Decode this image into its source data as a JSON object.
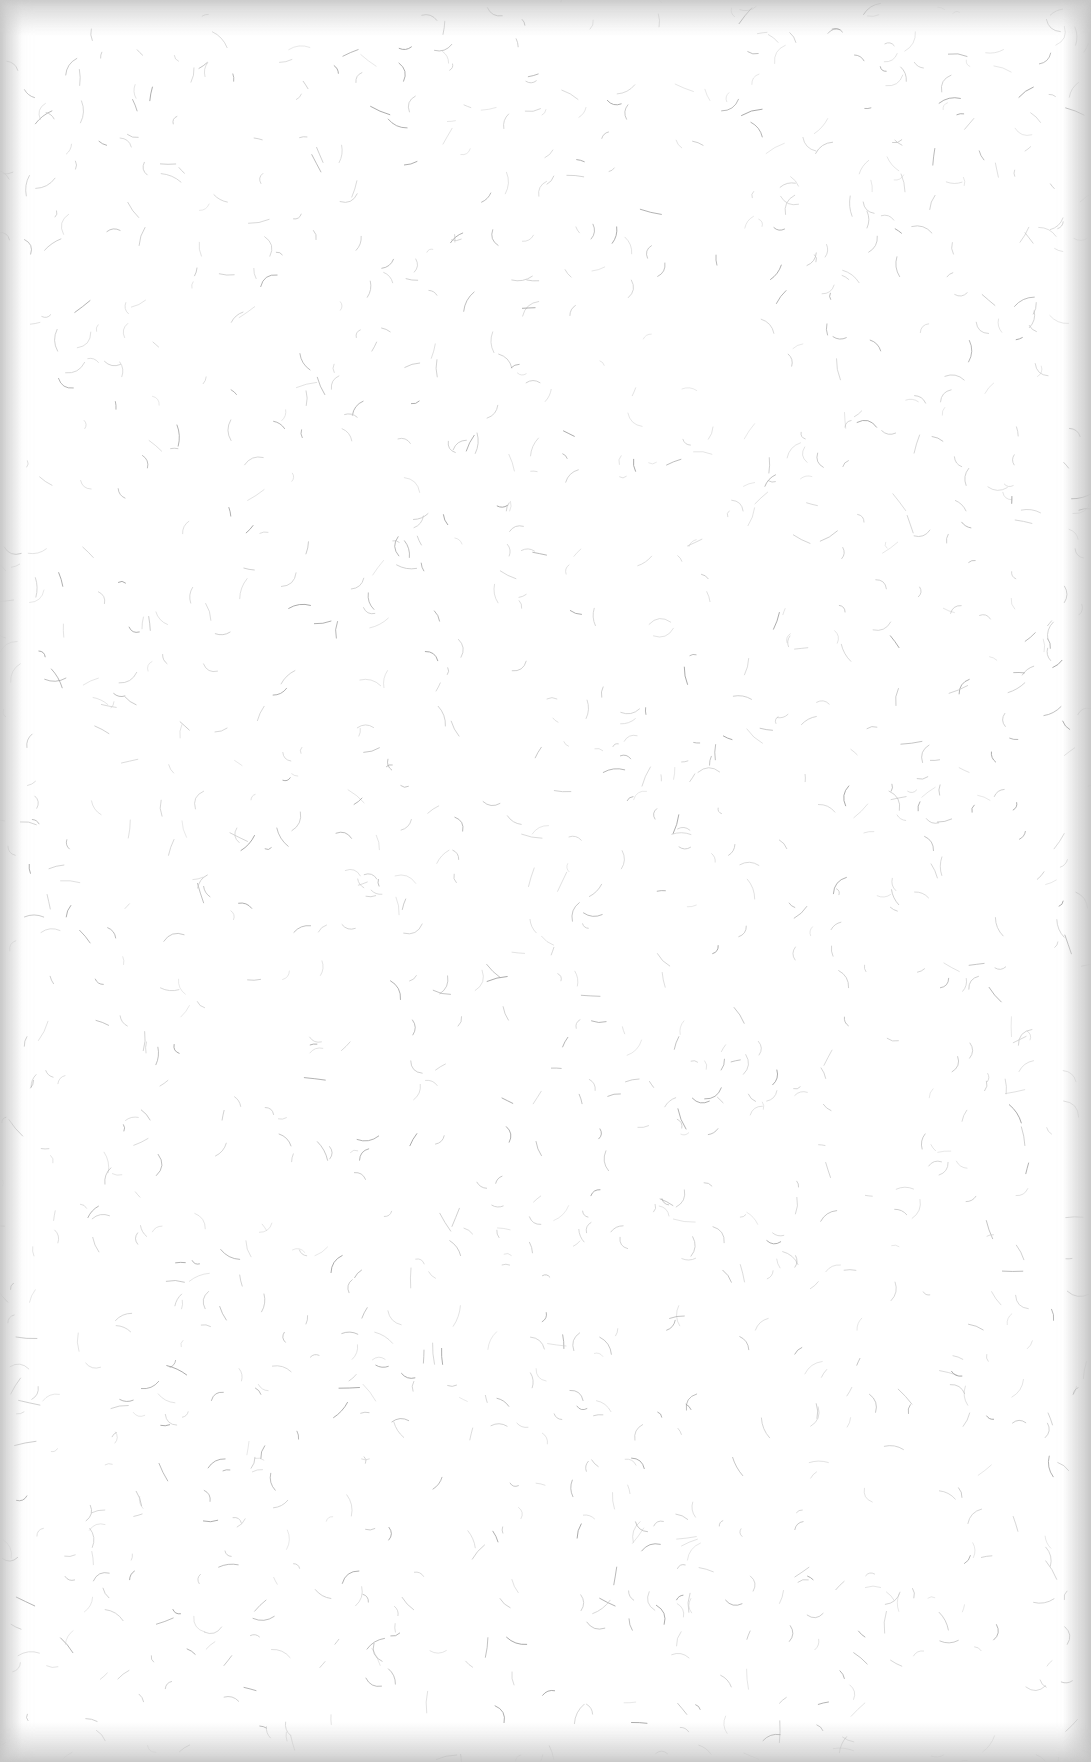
{
  "page": {
    "width": 1091,
    "height": 1762
  },
  "colors": {
    "paper": "#ffffff",
    "edge_shadow": "#d4d4d4",
    "fiber_dark": "#9a9a9a",
    "fiber_light": "#c8c8c8"
  },
  "texture": {
    "fiber_count": 1400,
    "seed": 17,
    "fiber_min_len": 6,
    "fiber_max_len": 22,
    "fiber_stroke_width": 0.9
  }
}
